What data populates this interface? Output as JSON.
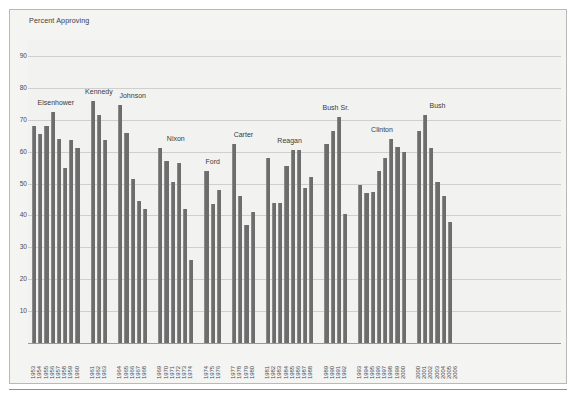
{
  "figure": {
    "y_axis_title": "Percent Approving"
  },
  "chart_data": {
    "type": "bar",
    "title": "",
    "xlabel": "",
    "ylabel": "Percent Approving",
    "ylim": [
      0,
      95
    ],
    "yticks": [
      10,
      20,
      30,
      40,
      50,
      60,
      70,
      80,
      90
    ],
    "grid": true,
    "legend": null,
    "bar_color": "#6d6d6d",
    "background_color": "#f2f2f1",
    "groups": [
      {
        "name": "Eisenhower",
        "categories": [
          "1953",
          "1954",
          "1955",
          "1956",
          "1957",
          "1958",
          "1959",
          "1960"
        ],
        "values": [
          68,
          65.5,
          68,
          72.5,
          64,
          55,
          63.5,
          61
        ]
      },
      {
        "name": "Kennedy",
        "categories": [
          "1961",
          "1962",
          "1963"
        ],
        "values": [
          76,
          71.5,
          63.5
        ]
      },
      {
        "name": "Johnson",
        "categories": [
          "1964",
          "1965",
          "1966",
          "1967",
          "1968"
        ],
        "values": [
          74.5,
          66,
          51.5,
          44.5,
          42
        ]
      },
      {
        "name": "Nixon",
        "categories": [
          "1969",
          "1970",
          "1971",
          "1972",
          "1973",
          "1974"
        ],
        "values": [
          61,
          57,
          50.5,
          56.5,
          42,
          26
        ]
      },
      {
        "name": "Ford",
        "categories": [
          "1974",
          "1975",
          "1976"
        ],
        "values": [
          54,
          43.5,
          48
        ]
      },
      {
        "name": "Carter",
        "categories": [
          "1977",
          "1978",
          "1979",
          "1980"
        ],
        "values": [
          62.5,
          46,
          37,
          41
        ]
      },
      {
        "name": "Reagan",
        "categories": [
          "1981",
          "1982",
          "1983",
          "1984",
          "1985",
          "1986",
          "1987",
          "1988"
        ],
        "values": [
          58,
          44,
          44,
          55.5,
          60.5,
          60.5,
          48.5,
          52
        ]
      },
      {
        "name": "Bush Sr.",
        "categories": [
          "1989",
          "1990",
          "1991",
          "1992"
        ],
        "values": [
          62.5,
          66.5,
          71,
          40.5
        ]
      },
      {
        "name": "Clinton",
        "categories": [
          "1993",
          "1994",
          "1995",
          "1996",
          "1997",
          "1998",
          "1999",
          "2000"
        ],
        "values": [
          49.5,
          47,
          47.5,
          54,
          58,
          64,
          61.5,
          60
        ]
      },
      {
        "name": "Bush",
        "categories": [
          "2000",
          "2001",
          "2002",
          "2003",
          "2004",
          "2005",
          "2006"
        ],
        "values": [
          66.5,
          71.5,
          61,
          50.5,
          46,
          38
        ]
      }
    ]
  }
}
